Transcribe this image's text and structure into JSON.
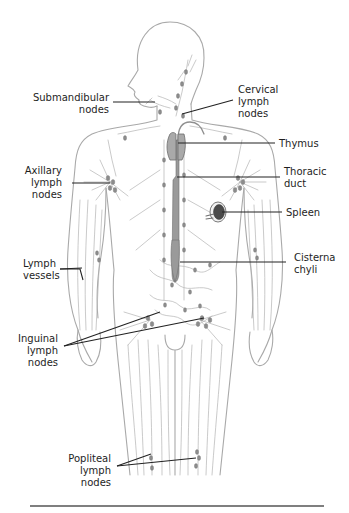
{
  "figure": {
    "labels": {
      "submandibular": [
        "Submandibular",
        "nodes"
      ],
      "cervical": [
        "Cervical",
        "lymph",
        "nodes"
      ],
      "thymus": [
        "Thymus"
      ],
      "axillary": [
        "Axillary",
        "lymph",
        "nodes"
      ],
      "thoracic": [
        "Thoracic",
        "duct"
      ],
      "spleen": [
        "Spleen"
      ],
      "lymph_vessels": [
        "Lymph",
        "vessels"
      ],
      "cisterna": [
        "Cisterna",
        "chyli"
      ],
      "inguinal": [
        "Inguinal",
        "lymph",
        "nodes"
      ],
      "popliteal": [
        "Popliteal",
        "lymph",
        "nodes"
      ]
    },
    "colors": {
      "outline": "#a9a9a9",
      "vessel": "#b3b3b3",
      "node": "#8c8c8c",
      "leader": "#222222",
      "text": "#1e1e1e"
    }
  }
}
